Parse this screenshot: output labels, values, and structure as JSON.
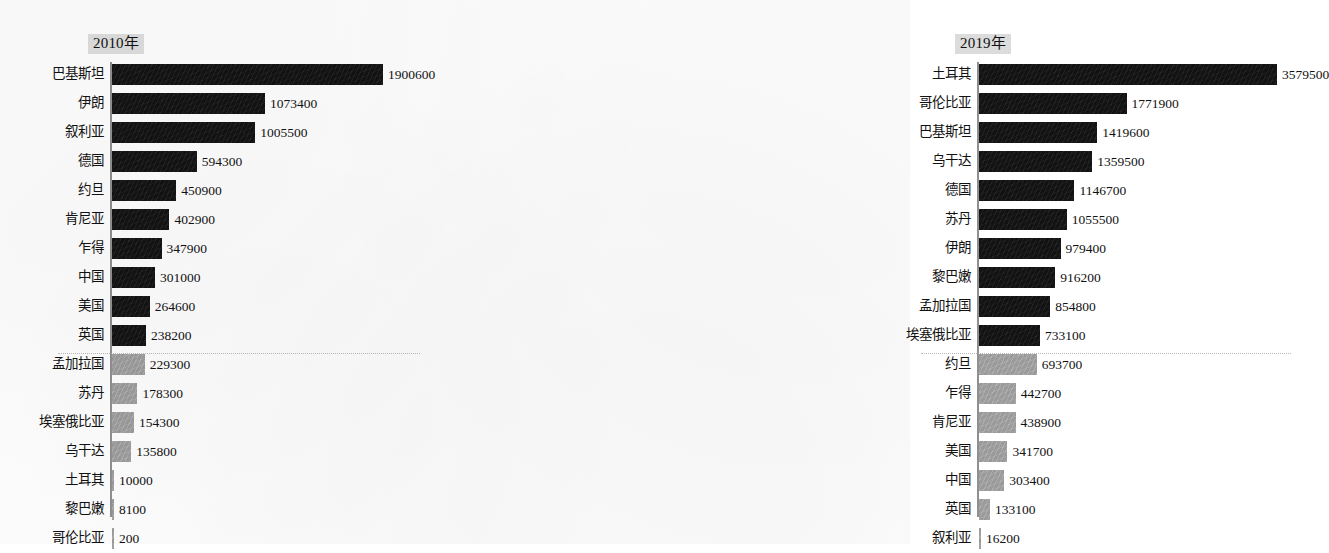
{
  "chart_data": {
    "type": "bar",
    "orientation": "horizontal",
    "title": "",
    "xlabel": "",
    "ylabel": "",
    "grid": false,
    "legend": false,
    "panels": [
      {
        "title": "2010年",
        "axis_max": 1900600,
        "separator_after_index": 9,
        "categories": [
          "巴基斯坦",
          "伊朗",
          "叙利亚",
          "德国",
          "约旦",
          "肯尼亚",
          "乍得",
          "中国",
          "美国",
          "英国",
          "孟加拉国",
          "苏丹",
          "埃塞俄比亚",
          "乌干达",
          "土耳其",
          "黎巴嫩",
          "哥伦比亚"
        ],
        "values": [
          1900600,
          1073400,
          1005500,
          594300,
          450900,
          402900,
          347900,
          301000,
          264600,
          238200,
          229300,
          178300,
          154300,
          135800,
          10000,
          8100,
          200
        ],
        "value_labels": [
          "1900600",
          "1073400",
          "1005500",
          "594300",
          "450900",
          "402900",
          "347900",
          "301000",
          "264600",
          "238200",
          "229300",
          "178300",
          "154300",
          "135800",
          "10000",
          "8100",
          "200"
        ]
      },
      {
        "title": "2019年",
        "axis_max": 3579500,
        "separator_after_index": 9,
        "categories": [
          "土耳其",
          "哥伦比亚",
          "巴基斯坦",
          "乌干达",
          "德国",
          "苏丹",
          "伊朗",
          "黎巴嫩",
          "孟加拉国",
          "埃塞俄比亚",
          "约旦",
          "乍得",
          "肯尼亚",
          "美国",
          "中国",
          "英国",
          "叙利亚"
        ],
        "values": [
          3579500,
          1771900,
          1419600,
          1359500,
          1146700,
          1055500,
          979400,
          916200,
          854800,
          733100,
          693700,
          442700,
          438900,
          341700,
          303400,
          133100,
          16200
        ],
        "value_labels": [
          "3579500",
          "1771900",
          "1419600",
          "1359500",
          "1146700",
          "1055500",
          "979400",
          "916200",
          "854800",
          "733100",
          "693700",
          "442700",
          "438900",
          "341700",
          "303400",
          "133100",
          "16200"
        ]
      }
    ],
    "colors": {
      "bar_top_group": "#121212",
      "bar_bottom_group": "#9a9a9a",
      "axis": "#8f8f8f",
      "title_background": "#dcdcdc",
      "separator": "#b9b9b9",
      "text": "#111111",
      "page_background": "#fdfdfd"
    }
  }
}
